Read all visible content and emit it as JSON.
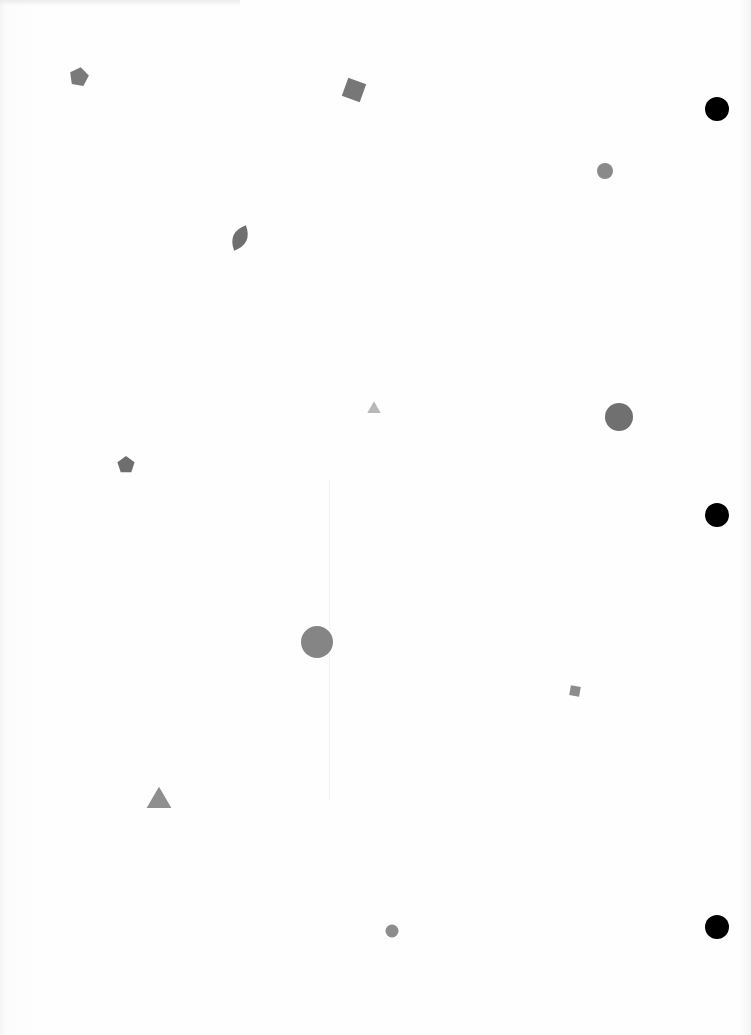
{
  "page": {
    "background": "#fdfdfd",
    "width": 751,
    "height": 1035
  },
  "shapes": [
    {
      "type": "pentagon",
      "x": 79,
      "y": 77,
      "size": 20,
      "rotation": 10,
      "color": "#7a7a7a"
    },
    {
      "type": "square",
      "x": 354,
      "y": 90,
      "size": 19,
      "rotation": 20,
      "color": "#777777"
    },
    {
      "type": "circle",
      "x": 605,
      "y": 171,
      "size": 16,
      "color": "#8a8a8a"
    },
    {
      "type": "leaf",
      "x": 240,
      "y": 238,
      "size": 28,
      "rotation": 25,
      "color": "#6f6f6f"
    },
    {
      "type": "triangle",
      "x": 374,
      "y": 409,
      "size": 14,
      "color": "#b8b8b8"
    },
    {
      "type": "circle",
      "x": 619,
      "y": 417,
      "size": 28,
      "color": "#707070"
    },
    {
      "type": "pentagon",
      "x": 126,
      "y": 465,
      "size": 18,
      "rotation": 0,
      "color": "#6e6e6e"
    },
    {
      "type": "circle",
      "x": 317,
      "y": 642,
      "size": 32,
      "color": "#858585"
    },
    {
      "type": "square",
      "x": 575,
      "y": 691,
      "size": 10,
      "rotation": 10,
      "color": "#8c8c8c"
    },
    {
      "type": "triangle",
      "x": 159,
      "y": 801,
      "size": 26,
      "color": "#8f8f8f"
    },
    {
      "type": "circle",
      "x": 392,
      "y": 931,
      "size": 13,
      "color": "#8d8d8d"
    }
  ],
  "holes": [
    {
      "x": 717,
      "y": 109,
      "size": 24,
      "color": "#000000"
    },
    {
      "x": 717,
      "y": 515,
      "size": 24,
      "color": "#000000"
    },
    {
      "x": 717,
      "y": 927,
      "size": 24,
      "color": "#000000"
    }
  ]
}
